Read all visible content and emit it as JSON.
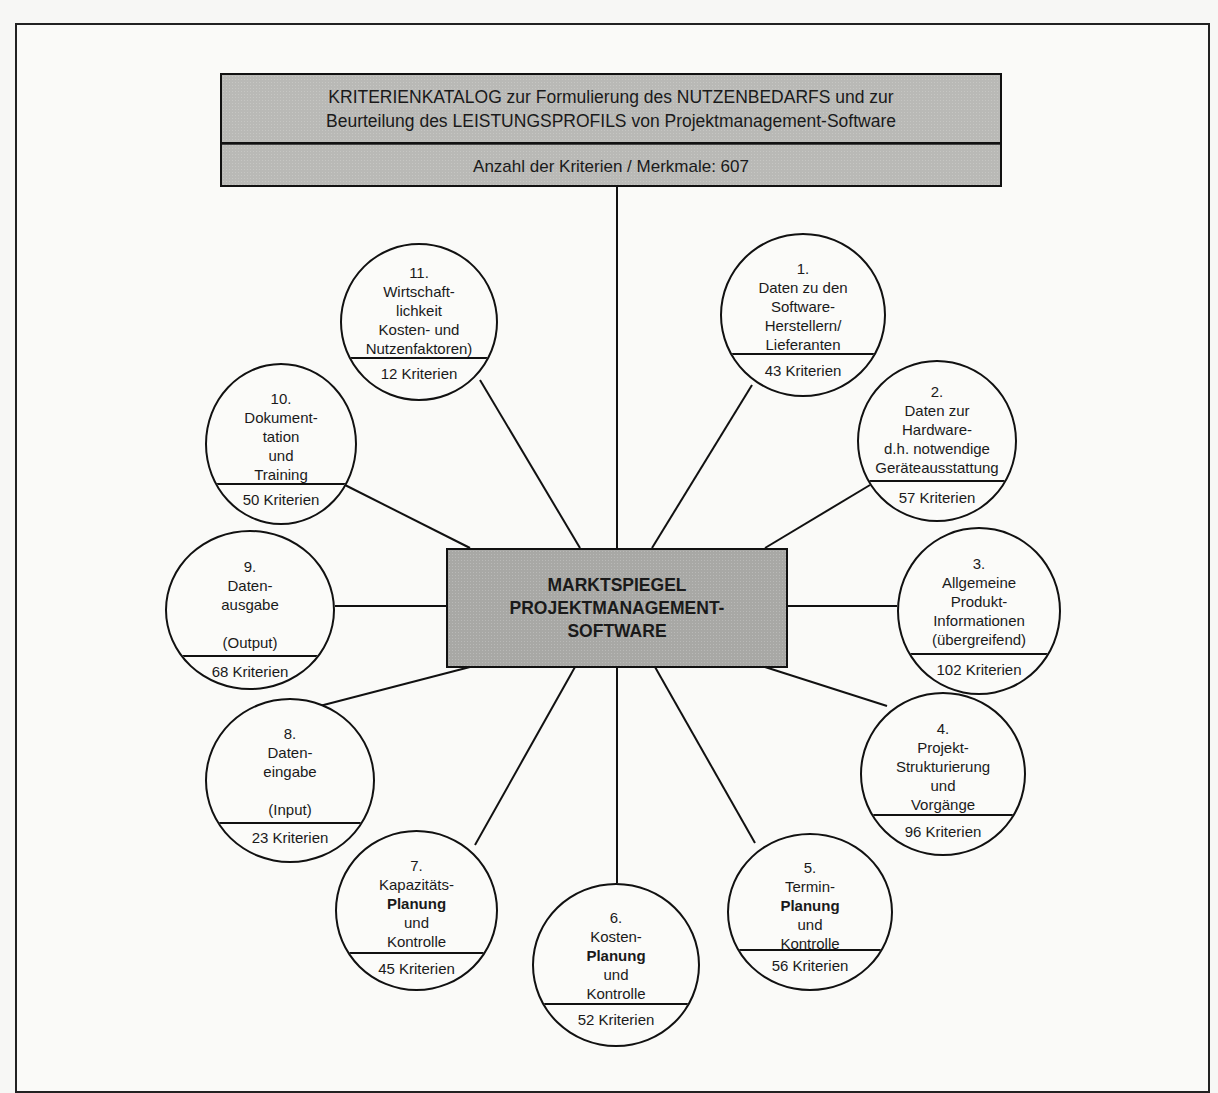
{
  "header": {
    "title_line1": "KRITERIENKATALOG zur Formulierung des NUTZENBEDARFS und zur",
    "title_line2": "Beurteilung des LEISTUNGSPROFILS von Projektmanagement-Software",
    "count_label": "Anzahl der Kriterien / Merkmale: 607"
  },
  "center": {
    "line1": "MARKTSPIEGEL",
    "line2": "PROJEKTMANAGEMENT-",
    "line3": "SOFTWARE"
  },
  "colors": {
    "box_fill": "#b9b9b6",
    "center_fill": "#a8a8a5",
    "stroke": "#111111",
    "background": "#fafaf8"
  },
  "nodes": [
    {
      "id": 1,
      "number": "1.",
      "lines": [
        "Daten zu den",
        "Software-",
        "Herstellern/",
        "Lieferanten"
      ],
      "criteria": "43 Kriterien"
    },
    {
      "id": 2,
      "number": "2.",
      "lines": [
        "Daten zur",
        "Hardware-",
        "d.h. notwendige",
        "Geräteausstattung"
      ],
      "criteria": "57 Kriterien"
    },
    {
      "id": 3,
      "number": "3.",
      "lines": [
        "Allgemeine",
        "Produkt-",
        "Informationen",
        "(übergreifend)"
      ],
      "criteria": "102 Kriterien"
    },
    {
      "id": 4,
      "number": "4.",
      "lines": [
        "Projekt-",
        "Strukturierung",
        "und",
        "Vorgänge"
      ],
      "criteria": "96 Kriterien"
    },
    {
      "id": 5,
      "number": "5.",
      "lines": [
        "Termin-",
        "Planung",
        "und",
        "Kontrolle"
      ],
      "criteria": "56 Kriterien"
    },
    {
      "id": 6,
      "number": "6.",
      "lines": [
        "Kosten-",
        "Planung",
        "und",
        "Kontrolle"
      ],
      "criteria": "52 Kriterien"
    },
    {
      "id": 7,
      "number": "7.",
      "lines": [
        "Kapazitäts-",
        "Planung",
        "und",
        "Kontrolle"
      ],
      "criteria": "45 Kriterien"
    },
    {
      "id": 8,
      "number": "8.",
      "lines": [
        "Daten-",
        "eingabe",
        "",
        "(Input)"
      ],
      "criteria": "23 Kriterien"
    },
    {
      "id": 9,
      "number": "9.",
      "lines": [
        "Daten-",
        "ausgabe",
        "",
        "(Output)"
      ],
      "criteria": "68 Kriterien"
    },
    {
      "id": 10,
      "number": "10.",
      "lines": [
        "Dokument-",
        "tation",
        "und",
        "Training"
      ],
      "criteria": "50 Kriterien"
    },
    {
      "id": 11,
      "number": "11.",
      "lines": [
        "Wirtschaft-",
        "lichkeit",
        "Kosten- und",
        "Nutzenfaktoren)"
      ],
      "criteria": "12 Kriterien"
    }
  ]
}
